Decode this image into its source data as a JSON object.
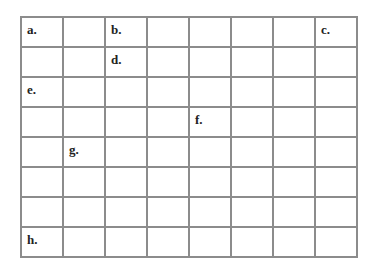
{
  "grid": {
    "rows": 8,
    "cols": 8,
    "line_color": "#8c8c8c",
    "cells": [
      [
        "a.",
        "",
        "b.",
        "",
        "",
        "",
        "",
        "c."
      ],
      [
        "",
        "",
        "d.",
        "",
        "",
        "",
        "",
        ""
      ],
      [
        "e.",
        "",
        "",
        "",
        "",
        "",
        "",
        ""
      ],
      [
        "",
        "",
        "",
        "",
        "f.",
        "",
        "",
        ""
      ],
      [
        "",
        "g.",
        "",
        "",
        "",
        "",
        "",
        ""
      ],
      [
        "",
        "",
        "",
        "",
        "",
        "",
        "",
        ""
      ],
      [
        "",
        "",
        "",
        "",
        "",
        "",
        "",
        ""
      ],
      [
        "h.",
        "",
        "",
        "",
        "",
        "",
        "",
        ""
      ]
    ]
  }
}
